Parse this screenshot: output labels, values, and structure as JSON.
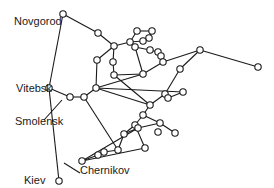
{
  "diagram": {
    "type": "network",
    "labels": {
      "novgorod": "Novgorod",
      "vitebsk": "Vitebsk",
      "smolensk": "Smolensk",
      "kiev": "Kiev",
      "chernikov": "Chernikov"
    },
    "colors": {
      "line": "#1a1a1a",
      "node_fill": "#ffffff",
      "background": "#ffffff"
    },
    "nodes": [
      [
        63,
        14
      ],
      [
        98,
        33
      ],
      [
        114,
        46
      ],
      [
        97,
        60
      ],
      [
        49,
        88
      ],
      [
        70,
        97
      ],
      [
        84,
        97
      ],
      [
        96,
        88
      ],
      [
        113,
        62
      ],
      [
        114,
        75
      ],
      [
        130,
        42
      ],
      [
        137,
        31
      ],
      [
        152,
        31
      ],
      [
        149,
        38
      ],
      [
        143,
        41
      ],
      [
        135,
        47
      ],
      [
        150,
        50
      ],
      [
        158,
        52
      ],
      [
        161,
        56
      ],
      [
        163,
        62
      ],
      [
        200,
        50
      ],
      [
        258,
        67
      ],
      [
        180,
        69
      ],
      [
        143,
        74
      ],
      [
        165,
        94
      ],
      [
        168,
        98
      ],
      [
        183,
        92
      ],
      [
        150,
        105
      ],
      [
        143,
        115
      ],
      [
        135,
        125
      ],
      [
        124,
        134
      ],
      [
        138,
        128
      ],
      [
        160,
        123
      ],
      [
        175,
        133
      ],
      [
        145,
        148
      ],
      [
        158,
        132
      ],
      [
        118,
        150
      ],
      [
        104,
        152
      ],
      [
        98,
        155
      ],
      [
        82,
        161
      ],
      [
        59,
        181
      ]
    ],
    "edges": [
      [
        0,
        1
      ],
      [
        1,
        2
      ],
      [
        0,
        4
      ],
      [
        2,
        3
      ],
      [
        3,
        7
      ],
      [
        2,
        10
      ],
      [
        10,
        11
      ],
      [
        11,
        12
      ],
      [
        12,
        13
      ],
      [
        13,
        14
      ],
      [
        14,
        10
      ],
      [
        10,
        15
      ],
      [
        15,
        16
      ],
      [
        16,
        17
      ],
      [
        17,
        18
      ],
      [
        18,
        19
      ],
      [
        19,
        20
      ],
      [
        20,
        21
      ],
      [
        20,
        22
      ],
      [
        22,
        24
      ],
      [
        24,
        25
      ],
      [
        2,
        8
      ],
      [
        8,
        9
      ],
      [
        9,
        23
      ],
      [
        23,
        15
      ],
      [
        23,
        19
      ],
      [
        4,
        5
      ],
      [
        5,
        6
      ],
      [
        6,
        7
      ],
      [
        7,
        23
      ],
      [
        7,
        27
      ],
      [
        7,
        26
      ],
      [
        26,
        25
      ],
      [
        27,
        28
      ],
      [
        28,
        29
      ],
      [
        29,
        30
      ],
      [
        30,
        31
      ],
      [
        31,
        32
      ],
      [
        32,
        33
      ],
      [
        28,
        32
      ],
      [
        27,
        24
      ],
      [
        6,
        36
      ],
      [
        36,
        37
      ],
      [
        37,
        38
      ],
      [
        38,
        39
      ],
      [
        39,
        31
      ],
      [
        29,
        34
      ],
      [
        34,
        39
      ],
      [
        4,
        40
      ],
      [
        36,
        30
      ],
      [
        9,
        27
      ]
    ]
  }
}
